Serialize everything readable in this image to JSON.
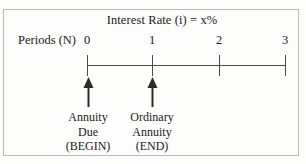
{
  "figure": {
    "title": "Interest Rate (i) = x%",
    "axis_label": "Periods (N)",
    "period_ticks": [
      {
        "label": "0",
        "x": 87
      },
      {
        "label": "1",
        "x": 152
      },
      {
        "label": "2",
        "x": 219
      },
      {
        "label": "3",
        "x": 285
      }
    ],
    "annotations": [
      {
        "name": "annuity-due",
        "x": 88,
        "line1": "Annuity",
        "line2": "Due",
        "line3": "(BEGIN)"
      },
      {
        "name": "ordinary-annuity",
        "x": 152,
        "line1": "Ordinary",
        "line2": "Annuity",
        "line3": "(END)"
      }
    ],
    "colors": {
      "border": "#b9b9b9",
      "axis": "#4a4a4a",
      "arrow": "#2b2b2b",
      "text": "#1a1a1a",
      "background": "#fdfdfc"
    }
  }
}
